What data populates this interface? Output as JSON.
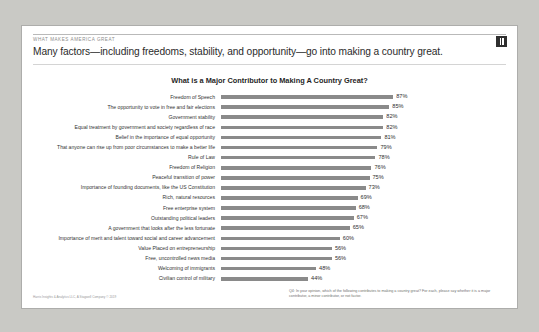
{
  "slide": {
    "kicker": "WHAT MAKES AMERICA GREAT",
    "headline": "Many factors—including freedoms, stability, and opportunity—go into making a country great.",
    "logo_name": "publisher-logo",
    "source": "Harris Insights & Analytics LLC, A Stagwell Company © 2019",
    "footnote": "Q4: In your opinion, which of the following contributes to making a country great? For each, please say whether it is a major contributor, a minor contributor, or not factor."
  },
  "chart_data": {
    "type": "bar",
    "title": "What is a Major Contributor to Making A Country Great?",
    "xlabel": "",
    "ylabel": "",
    "xlim": [
      0,
      100
    ],
    "grid": false,
    "legend": "none",
    "orientation": "horizontal",
    "value_suffix": "%",
    "bar_color": "#8a8a8a",
    "categories": [
      "Freedom of Speech",
      "The opportunity to vote in free and fair elections",
      "Government stability",
      "Equal treatment by government and society regardless of race",
      "Belief in the importance of equal opportunity",
      "That anyone can rise up from poor circumstances to make a better life",
      "Rule of Law",
      "Freedom of Religion",
      "Peaceful transition of power",
      "Importance of founding documents, like the US Constitution",
      "Rich, natural resources",
      "Free enterprise system",
      "Outstanding political leaders",
      "A government that looks after the less fortunate",
      "Importance of merit and talent toward social and career advancement",
      "Value Placed on entrepreneurship",
      "Free, uncontrolled news media",
      "Welcoming of immigrants",
      "Civilian control of military"
    ],
    "values": [
      87,
      85,
      82,
      82,
      81,
      79,
      78,
      76,
      75,
      73,
      69,
      68,
      67,
      65,
      60,
      56,
      56,
      48,
      44
    ],
    "labels": [
      "87%",
      "85%",
      "82%",
      "82%",
      "81%",
      "79%",
      "78%",
      "76%",
      "75%",
      "73%",
      "69%",
      "68%",
      "67%",
      "65%",
      "60%",
      "56%",
      "56%",
      "48%",
      "44%"
    ]
  }
}
